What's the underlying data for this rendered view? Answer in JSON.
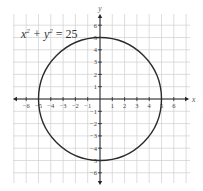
{
  "chart_data": {
    "type": "line",
    "equation": {
      "lhs_x": "x",
      "lhs_y": "y",
      "exp": "2",
      "rhs": "25"
    },
    "xlabel": "x",
    "ylabel": "y",
    "xlim": [
      -7,
      7
    ],
    "ylim": [
      -7,
      7
    ],
    "grid": true,
    "x_ticks": [
      -6,
      -5,
      -4,
      -3,
      -2,
      -1,
      1,
      2,
      3,
      4,
      5,
      6
    ],
    "y_ticks": [
      -6,
      -5,
      -4,
      -3,
      -2,
      -1,
      1,
      2,
      3,
      4,
      5,
      6
    ],
    "series": [
      {
        "name": "circle",
        "center": [
          0,
          0
        ],
        "radius": 5,
        "color": "#2b2b2b"
      }
    ]
  },
  "colors": {
    "grid": "#d0d0d0",
    "axis": "#222222",
    "curve": "#2b2b2b"
  }
}
